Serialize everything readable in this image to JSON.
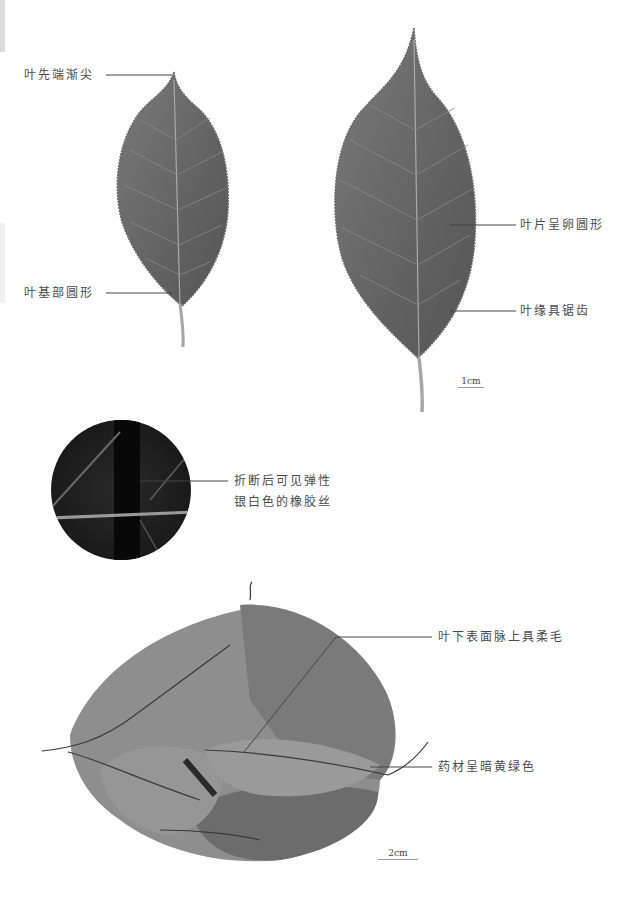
{
  "figure": {
    "panels": [
      {
        "name": "fresh-leaves",
        "labels": {
          "apex": "叶先端渐尖",
          "base": "叶基部圆形",
          "blade": "叶片呈卵圆形",
          "margin": "叶缘具锯齿"
        },
        "scale_bar": "1cm"
      },
      {
        "name": "magnified-break",
        "labels": {
          "line1": "折断后可见弹性",
          "line2": "银白色的橡胶丝"
        }
      },
      {
        "name": "dried-herb",
        "labels": {
          "underside": "叶下表面脉上具柔毛",
          "color": "药材呈暗黄绿色"
        },
        "scale_bar": "2cm"
      }
    ],
    "colors": {
      "leaf": "#6e6e6e",
      "leaf_dark": "#555555",
      "vein": "#a9a9a9",
      "magnifier_bg": "#1e1e1e",
      "dried_leaf": "#8c8c8c",
      "text": "#4a4a4a"
    }
  }
}
